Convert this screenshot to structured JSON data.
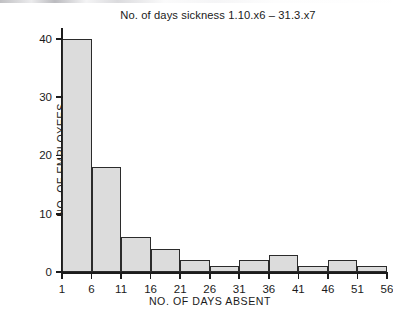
{
  "chart_data": {
    "type": "bar",
    "title": "No. of days sickness 1.10.x6 – 31.3.x7",
    "xlabel": "NO. OF DAYS ABSENT",
    "ylabel": "NO. OF EMPLOYEES",
    "categories": [
      "1-6",
      "6-11",
      "11-16",
      "16-21",
      "21-26",
      "26-31",
      "31-36",
      "36-41",
      "41-46",
      "46-51",
      "51-56"
    ],
    "bin_edges": [
      1,
      6,
      11,
      16,
      21,
      26,
      31,
      36,
      41,
      46,
      51,
      56
    ],
    "values": [
      40,
      18,
      6,
      4,
      2,
      1,
      2,
      3,
      1,
      2,
      1
    ],
    "xtick_labels": [
      "1",
      "6",
      "11",
      "16",
      "21",
      "26",
      "31",
      "36",
      "41",
      "46",
      "51",
      "56"
    ],
    "ytick_labels": [
      "0",
      "10",
      "20",
      "30",
      "40"
    ],
    "ytick_values": [
      0,
      10,
      20,
      30,
      40
    ],
    "ylim": [
      0,
      41
    ],
    "xlim": [
      1,
      56
    ],
    "grid": false,
    "legend": false,
    "bar_fill_color": "#dcdcdc",
    "bar_edge_color": "#2b2b2b",
    "axis_color": "#1c1c1c",
    "background_color": "#ffffff"
  }
}
